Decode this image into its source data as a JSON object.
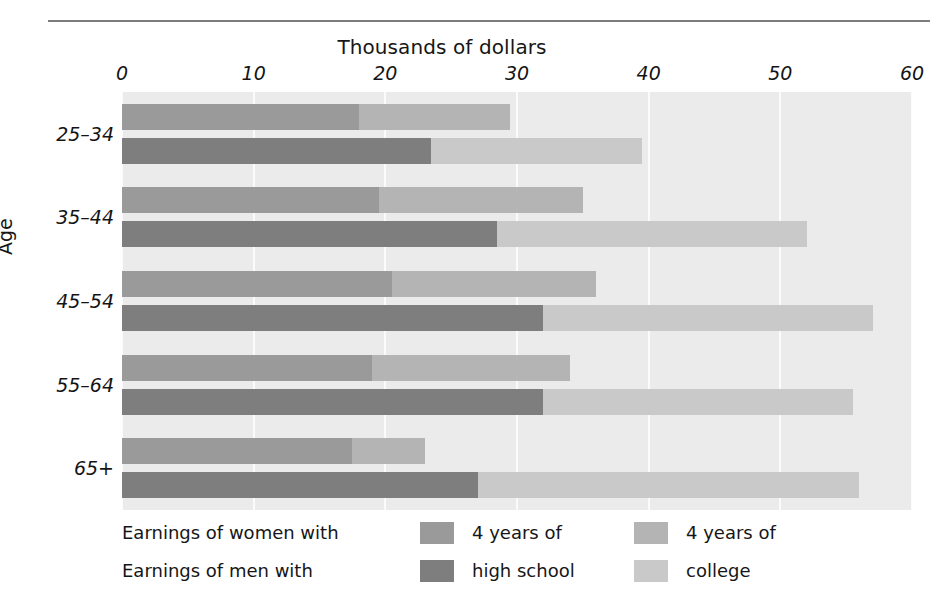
{
  "figure": {
    "top_rule": true,
    "axis_title_top": "Thousands of dollars",
    "y_axis_title": "Age"
  },
  "legend": {
    "row1_text": "Earnings of women with",
    "row2_text": "Earnings of men with",
    "key1_line1": "4 years of",
    "key1_line2": "high school",
    "key2_line1": "4 years of",
    "key2_line2": "college",
    "swatch_women_hs": "#9a9a9a",
    "swatch_women_col": "#b4b4b4",
    "swatch_men_hs": "#7e7e7e",
    "swatch_men_col": "#c9c9c9"
  },
  "colors": {
    "plot_background": "#ebebeb",
    "gridline": "#fbfbfb",
    "women_high_school": "#9a9a9a",
    "women_college": "#b4b4b4",
    "men_high_school": "#7e7e7e",
    "men_college": "#c9c9c9",
    "rule": "#7d7d7d",
    "text": "#161616"
  },
  "chart_data": {
    "type": "bar",
    "orientation": "horizontal",
    "stacked": true,
    "title": "",
    "xlabel": "Thousands of dollars",
    "ylabel": "Age",
    "xlim": [
      0,
      60
    ],
    "xticks": [
      0,
      10,
      20,
      30,
      40,
      50,
      60
    ],
    "xticklabels": [
      "0",
      "10",
      "20",
      "30",
      "40",
      "50",
      "60"
    ],
    "grid": "vertical",
    "legend_position": "bottom",
    "categories": [
      "25–34",
      "35–44",
      "45–54",
      "55–64",
      "65+"
    ],
    "series": [
      {
        "name": "Earnings of women with 4 years of high school",
        "group": "women",
        "segment": "high school",
        "color": "#9a9a9a",
        "values": [
          18.0,
          19.5,
          20.5,
          19.0,
          17.5
        ]
      },
      {
        "name": "Earnings of women with 4 years of college",
        "group": "women",
        "segment": "college",
        "color": "#b4b4b4",
        "values": [
          29.5,
          35.0,
          36.0,
          34.0,
          23.0
        ]
      },
      {
        "name": "Earnings of men with 4 years of high school",
        "group": "men",
        "segment": "high school",
        "color": "#7e7e7e",
        "values": [
          23.5,
          28.5,
          32.0,
          32.0,
          27.0
        ]
      },
      {
        "name": "Earnings of men with 4 years of college",
        "group": "men",
        "segment": "college",
        "color": "#c9c9c9",
        "values": [
          39.5,
          52.0,
          57.0,
          55.5,
          56.0
        ]
      }
    ]
  }
}
